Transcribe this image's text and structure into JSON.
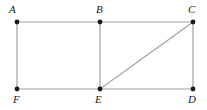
{
  "figure": {
    "name": "rectangle-with-diagonal-diagram",
    "background_color": "#ffffff",
    "stroke_color": "#a0a0a0",
    "vertex_color": "#1a1a1a",
    "label_color": "#1a1a1a",
    "stroke_width": 1.2,
    "vertex_radius": 2.4,
    "width": 207,
    "height": 110
  },
  "vertices": [
    {
      "id": "A",
      "label": "A",
      "x": 17,
      "y": 22,
      "label_x": 9,
      "label_y": 4
    },
    {
      "id": "B",
      "label": "B",
      "x": 100,
      "y": 22,
      "label_x": 96,
      "label_y": 4
    },
    {
      "id": "C",
      "label": "C",
      "x": 193,
      "y": 22,
      "label_x": 188,
      "label_y": 4
    },
    {
      "id": "F",
      "label": "F",
      "x": 17,
      "y": 89,
      "label_x": 13,
      "label_y": 94
    },
    {
      "id": "E",
      "label": "E",
      "x": 100,
      "y": 89,
      "label_x": 95,
      "label_y": 94
    },
    {
      "id": "D",
      "label": "D",
      "x": 193,
      "y": 89,
      "label_x": 188,
      "label_y": 94
    }
  ],
  "segments": [
    {
      "id": "AC",
      "from": "A",
      "to": "C",
      "x1": 17,
      "y1": 22,
      "x2": 193,
      "y2": 22
    },
    {
      "id": "FD",
      "from": "F",
      "to": "D",
      "x1": 17,
      "y1": 89,
      "x2": 193,
      "y2": 89
    },
    {
      "id": "AF",
      "from": "A",
      "to": "F",
      "x1": 17,
      "y1": 22,
      "x2": 17,
      "y2": 89
    },
    {
      "id": "BE",
      "from": "B",
      "to": "E",
      "x1": 100,
      "y1": 22,
      "x2": 100,
      "y2": 89
    },
    {
      "id": "CD",
      "from": "C",
      "to": "D",
      "x1": 193,
      "y1": 22,
      "x2": 193,
      "y2": 89
    },
    {
      "id": "EC",
      "from": "E",
      "to": "C",
      "x1": 100,
      "y1": 89,
      "x2": 193,
      "y2": 22
    }
  ]
}
